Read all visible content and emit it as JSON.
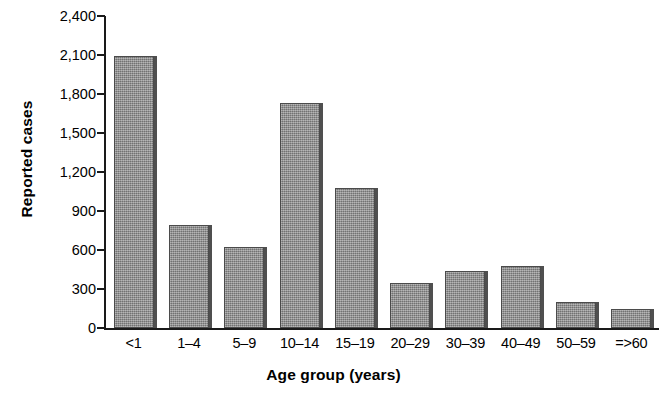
{
  "chart_data": {
    "type": "bar",
    "title": "",
    "xlabel": "Age group (years)",
    "ylabel": "Reported cases",
    "categories": [
      "<1",
      "1–4",
      "5–9",
      "10–14",
      "15–19",
      "20–29",
      "30–39",
      "40–49",
      "50–59",
      "=>60"
    ],
    "values": [
      2090,
      790,
      620,
      1730,
      1080,
      350,
      440,
      480,
      200,
      150
    ],
    "ylim": [
      0,
      2400
    ],
    "ytick_values": [
      0,
      300,
      600,
      900,
      1200,
      1500,
      1800,
      2100,
      2400
    ],
    "ytick_labels": [
      "0",
      "300",
      "600",
      "900",
      "1,200",
      "1,500",
      "1,800",
      "2,100",
      "2,400"
    ],
    "grid": false,
    "legend": null,
    "bar_color": "#8c8c8c",
    "bar_edge_color": "#4b4b4b",
    "axis_color": "#1a1a1a",
    "background_color": "#ffffff"
  }
}
